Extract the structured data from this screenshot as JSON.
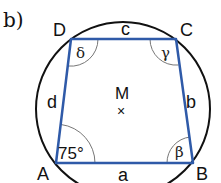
{
  "part_label": "b)",
  "colors": {
    "circle": "#111111",
    "quadrilateral": "#2f5aa8",
    "angle_arc": "#777777"
  },
  "circle": {
    "center": "M",
    "center_marker": "×"
  },
  "vertices": {
    "A": "A",
    "B": "B",
    "C": "C",
    "D": "D"
  },
  "sides": {
    "a": "a",
    "b": "b",
    "c": "c",
    "d": "d"
  },
  "angles": {
    "alpha": "75°",
    "beta": "β",
    "gamma": "γ",
    "delta": "δ"
  }
}
